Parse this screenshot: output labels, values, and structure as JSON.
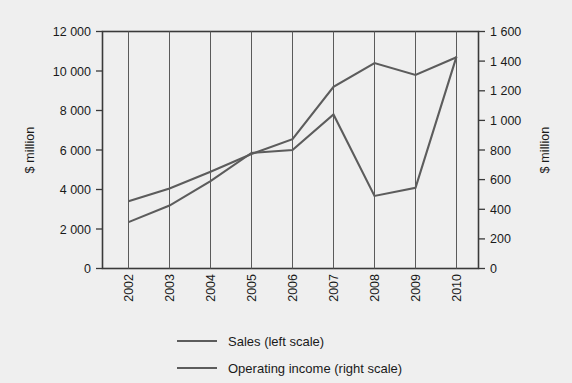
{
  "chart_data": {
    "type": "line",
    "title": "",
    "subtitle": "",
    "xlabel": "",
    "ylabel": "$ million",
    "y2label": "$ million",
    "categories": [
      "2002",
      "2003",
      "2004",
      "2005",
      "2006",
      "2007",
      "2008",
      "2009",
      "2010"
    ],
    "series": [
      {
        "name": "Sales (left scale)",
        "axis": "left",
        "values": [
          3400,
          4050,
          4900,
          5800,
          6550,
          9200,
          10400,
          9800,
          10700
        ]
      },
      {
        "name": "Operating income (right scale)",
        "axis": "right",
        "values": [
          313,
          425,
          590,
          780,
          800,
          1040,
          490,
          545,
          1430
        ]
      }
    ],
    "ylim": [
      0,
      12000
    ],
    "y2lim": [
      0,
      1600
    ],
    "yticks": [
      "0",
      "2 000",
      "4 000",
      "6 000",
      "8 000",
      "10 000",
      "12 000"
    ],
    "ytick_values": [
      0,
      2000,
      4000,
      6000,
      8000,
      10000,
      12000
    ],
    "y2ticks": [
      "0",
      "200",
      "400",
      "600",
      "800",
      "1 000",
      "1 200",
      "1 400",
      "1 600"
    ],
    "y2tick_values": [
      0,
      200,
      400,
      600,
      800,
      1000,
      1200,
      1400,
      1600
    ],
    "grid": "vertical",
    "legend_position": "bottom",
    "line_color": "#5c5c5c",
    "background_color": "#efefef"
  },
  "legend": {
    "items": [
      {
        "label": "Sales (left scale)"
      },
      {
        "label": "Operating income (right scale)"
      }
    ]
  },
  "axes": {
    "left_title": "$ million",
    "right_title": "$ million"
  }
}
